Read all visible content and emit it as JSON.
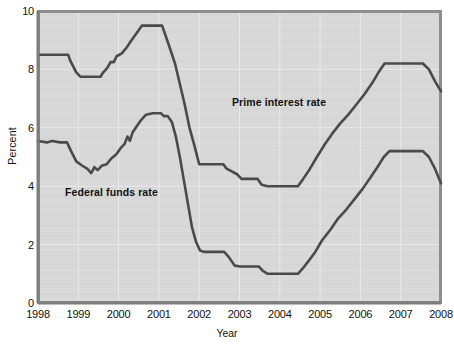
{
  "chart_data": {
    "type": "line",
    "title": "",
    "xlabel": "Year",
    "ylabel": "Percent",
    "xlim": [
      1998,
      2008
    ],
    "ylim": [
      0,
      10
    ],
    "ytick_labels": [
      "0",
      "2",
      "4",
      "6",
      "8",
      "10"
    ],
    "ytick_values": [
      0,
      2,
      4,
      6,
      8,
      10
    ],
    "xtick_labels": [
      "1998",
      "1999",
      "2000",
      "2001",
      "2002",
      "2003",
      "2004",
      "2005",
      "2006",
      "2007",
      "2008"
    ],
    "xtick_values": [
      1998,
      1999,
      2000,
      2001,
      2002,
      2003,
      2004,
      2005,
      2006,
      2007,
      2008
    ],
    "grid": true,
    "legend_position": "inline-annotations",
    "plot_background": "#d8d8d8",
    "line_color": "#4a4a4a",
    "series": [
      {
        "name": "Prime interest rate",
        "label_text": "Prime interest rate",
        "color": "#4a4a4a",
        "points": [
          [
            1998.0,
            8.5
          ],
          [
            1998.75,
            8.5
          ],
          [
            1998.8,
            8.3
          ],
          [
            1998.95,
            7.9
          ],
          [
            1999.05,
            7.75
          ],
          [
            1999.55,
            7.75
          ],
          [
            1999.62,
            7.9
          ],
          [
            1999.72,
            8.05
          ],
          [
            1999.8,
            8.25
          ],
          [
            1999.88,
            8.25
          ],
          [
            1999.95,
            8.45
          ],
          [
            2000.08,
            8.55
          ],
          [
            2000.2,
            8.75
          ],
          [
            2000.32,
            9.0
          ],
          [
            2000.45,
            9.25
          ],
          [
            2000.58,
            9.5
          ],
          [
            2001.08,
            9.5
          ],
          [
            2001.18,
            9.1
          ],
          [
            2001.28,
            8.7
          ],
          [
            2001.4,
            8.2
          ],
          [
            2001.52,
            7.5
          ],
          [
            2001.64,
            6.8
          ],
          [
            2001.76,
            6.0
          ],
          [
            2001.88,
            5.4
          ],
          [
            2002.0,
            4.75
          ],
          [
            2002.6,
            4.75
          ],
          [
            2002.68,
            4.6
          ],
          [
            2002.95,
            4.4
          ],
          [
            2003.05,
            4.25
          ],
          [
            2003.45,
            4.25
          ],
          [
            2003.55,
            4.05
          ],
          [
            2003.7,
            4.0
          ],
          [
            2004.45,
            4.0
          ],
          [
            2004.58,
            4.25
          ],
          [
            2004.75,
            4.6
          ],
          [
            2004.92,
            5.0
          ],
          [
            2005.1,
            5.4
          ],
          [
            2005.3,
            5.8
          ],
          [
            2005.5,
            6.15
          ],
          [
            2005.7,
            6.45
          ],
          [
            2005.9,
            6.8
          ],
          [
            2006.1,
            7.15
          ],
          [
            2006.3,
            7.55
          ],
          [
            2006.45,
            7.9
          ],
          [
            2006.6,
            8.2
          ],
          [
            2007.55,
            8.2
          ],
          [
            2007.7,
            8.0
          ],
          [
            2007.85,
            7.6
          ],
          [
            2008.0,
            7.25
          ]
        ]
      },
      {
        "name": "Federal funds rate",
        "label_text": "Federal funds rate",
        "color": "#4a4a4a",
        "points": [
          [
            1998.0,
            5.55
          ],
          [
            1998.22,
            5.5
          ],
          [
            1998.35,
            5.55
          ],
          [
            1998.55,
            5.5
          ],
          [
            1998.72,
            5.5
          ],
          [
            1998.82,
            5.2
          ],
          [
            1998.95,
            4.85
          ],
          [
            1999.1,
            4.7
          ],
          [
            1999.22,
            4.6
          ],
          [
            1999.32,
            4.45
          ],
          [
            1999.4,
            4.65
          ],
          [
            1999.48,
            4.55
          ],
          [
            1999.58,
            4.7
          ],
          [
            1999.7,
            4.75
          ],
          [
            1999.82,
            4.95
          ],
          [
            1999.95,
            5.1
          ],
          [
            2000.05,
            5.3
          ],
          [
            2000.15,
            5.45
          ],
          [
            2000.22,
            5.7
          ],
          [
            2000.28,
            5.55
          ],
          [
            2000.35,
            5.85
          ],
          [
            2000.45,
            6.05
          ],
          [
            2000.55,
            6.25
          ],
          [
            2000.68,
            6.45
          ],
          [
            2000.85,
            6.5
          ],
          [
            2001.05,
            6.5
          ],
          [
            2001.12,
            6.4
          ],
          [
            2001.22,
            6.4
          ],
          [
            2001.32,
            6.2
          ],
          [
            2001.42,
            5.7
          ],
          [
            2001.52,
            5.0
          ],
          [
            2001.62,
            4.2
          ],
          [
            2001.72,
            3.4
          ],
          [
            2001.82,
            2.6
          ],
          [
            2001.92,
            2.1
          ],
          [
            2002.02,
            1.8
          ],
          [
            2002.12,
            1.75
          ],
          [
            2002.62,
            1.75
          ],
          [
            2002.72,
            1.6
          ],
          [
            2002.88,
            1.28
          ],
          [
            2003.02,
            1.25
          ],
          [
            2003.48,
            1.25
          ],
          [
            2003.58,
            1.1
          ],
          [
            2003.7,
            1.0
          ],
          [
            2004.45,
            1.0
          ],
          [
            2004.58,
            1.2
          ],
          [
            2004.72,
            1.45
          ],
          [
            2004.88,
            1.75
          ],
          [
            2005.05,
            2.15
          ],
          [
            2005.25,
            2.5
          ],
          [
            2005.45,
            2.9
          ],
          [
            2005.65,
            3.2
          ],
          [
            2005.85,
            3.55
          ],
          [
            2006.05,
            3.9
          ],
          [
            2006.25,
            4.3
          ],
          [
            2006.42,
            4.65
          ],
          [
            2006.58,
            5.0
          ],
          [
            2006.72,
            5.2
          ],
          [
            2007.55,
            5.2
          ],
          [
            2007.7,
            5.0
          ],
          [
            2007.85,
            4.6
          ],
          [
            2008.0,
            4.1
          ]
        ]
      }
    ]
  },
  "axes": {
    "ylabel": "Percent",
    "xlabel": "Year"
  }
}
